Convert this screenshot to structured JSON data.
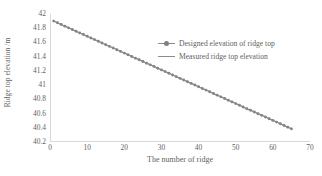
{
  "chart_data": {
    "type": "line",
    "title": "",
    "xlabel": "The number of ridge",
    "ylabel": "Ridge top elevation /m",
    "xlim": [
      0,
      70
    ],
    "ylim": [
      40.2,
      42
    ],
    "xticks": [
      "0",
      "10",
      "20",
      "30",
      "40",
      "50",
      "60",
      "70"
    ],
    "xtick_values": [
      0,
      10,
      20,
      30,
      40,
      50,
      60,
      70
    ],
    "yticks": [
      "40.2",
      "40.4",
      "40.6",
      "40.8",
      "41",
      "41.2",
      "41.4",
      "41.6",
      "41.8",
      "42"
    ],
    "ytick_values": [
      40.2,
      40.4,
      40.6,
      40.8,
      41.0,
      41.2,
      41.4,
      41.6,
      41.8,
      42.0
    ],
    "grid": false,
    "legend_position": "center-right-upper",
    "series": [
      {
        "name": "Designed elevation of ridge top",
        "marker": "dot",
        "color": "#808080",
        "x": [
          1,
          2,
          3,
          4,
          5,
          6,
          7,
          8,
          9,
          10,
          11,
          12,
          13,
          14,
          15,
          16,
          17,
          18,
          19,
          20,
          21,
          22,
          23,
          24,
          25,
          26,
          27,
          28,
          29,
          30,
          31,
          32,
          33,
          34,
          35,
          36,
          37,
          38,
          39,
          40,
          41,
          42,
          43,
          44,
          45,
          46,
          47,
          48,
          49,
          50,
          51,
          52,
          53,
          54,
          55,
          56,
          57,
          58,
          59,
          60,
          61,
          62,
          63,
          64,
          65
        ],
        "values": [
          41.9,
          41.876,
          41.853,
          41.829,
          41.805,
          41.782,
          41.758,
          41.734,
          41.711,
          41.687,
          41.663,
          41.64,
          41.616,
          41.592,
          41.569,
          41.545,
          41.521,
          41.498,
          41.474,
          41.45,
          41.427,
          41.403,
          41.379,
          41.356,
          41.332,
          41.308,
          41.285,
          41.261,
          41.237,
          41.214,
          41.19,
          41.166,
          41.143,
          41.119,
          41.095,
          41.072,
          41.048,
          41.024,
          41.001,
          40.977,
          40.953,
          40.93,
          40.906,
          40.882,
          40.859,
          40.835,
          40.811,
          40.788,
          40.764,
          40.74,
          40.717,
          40.693,
          40.669,
          40.646,
          40.622,
          40.598,
          40.575,
          40.551,
          40.527,
          40.504,
          40.48,
          40.456,
          40.433,
          40.409,
          40.385
        ]
      },
      {
        "name": "Measured ridge top elevation",
        "marker": "none",
        "color": "#8c8c8c",
        "x": [
          1,
          2,
          3,
          4,
          5,
          6,
          7,
          8,
          9,
          10,
          11,
          12,
          13,
          14,
          15,
          16,
          17,
          18,
          19,
          20,
          21,
          22,
          23,
          24,
          25,
          26,
          27,
          28,
          29,
          30,
          31,
          32,
          33,
          34,
          35,
          36,
          37,
          38,
          39,
          40,
          41,
          42,
          43,
          44,
          45,
          46,
          47,
          48,
          49,
          50,
          51,
          52,
          53,
          54,
          55,
          56,
          57,
          58,
          59,
          60,
          61,
          62,
          63,
          64,
          65
        ],
        "values": [
          41.901,
          41.874,
          41.856,
          41.827,
          41.808,
          41.78,
          41.761,
          41.736,
          41.708,
          41.69,
          41.661,
          41.643,
          41.614,
          41.595,
          41.572,
          41.543,
          41.524,
          41.5,
          41.477,
          41.448,
          41.43,
          41.401,
          41.382,
          41.359,
          41.33,
          41.311,
          41.288,
          41.264,
          41.235,
          41.217,
          41.193,
          41.164,
          41.146,
          41.122,
          41.093,
          41.075,
          41.051,
          41.027,
          41.004,
          40.975,
          40.956,
          40.933,
          40.909,
          40.875,
          40.862,
          40.838,
          40.814,
          40.791,
          40.767,
          40.743,
          40.72,
          40.696,
          40.656,
          40.649,
          40.625,
          40.601,
          40.578,
          40.554,
          40.53,
          40.507,
          40.483,
          40.459,
          40.436,
          40.412,
          40.388
        ]
      }
    ]
  },
  "legend": {
    "items": [
      {
        "label": "Designed elevation of ridge top"
      },
      {
        "label": "Measured ridge top elevation"
      }
    ]
  },
  "axes": {
    "x_title": "The number of ridge",
    "y_title": "Ridge top elevation /m"
  },
  "colors": {
    "series_designed": "#808080",
    "series_measured": "#8c8c8c",
    "axis": "#d9d9d9",
    "text": "#5f5f5f",
    "background": "#ffffff"
  }
}
